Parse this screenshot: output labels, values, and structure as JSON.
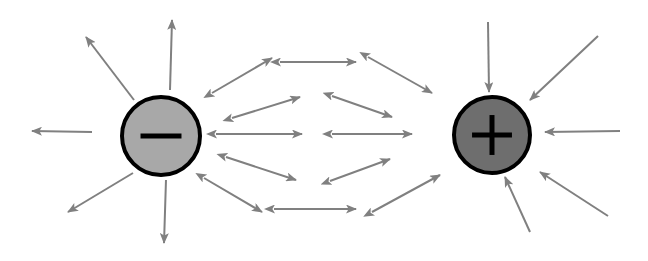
{
  "figure": {
    "width": 648,
    "height": 261,
    "background_color": "#ffffff"
  },
  "colors": {
    "arrow": "#808080",
    "arrow_dark": "#707070",
    "negative_fill": "#a8a8a8",
    "positive_fill": "#6e6e6e",
    "charge_outline": "#000000",
    "sign_glyph": "#000000"
  },
  "charges": [
    {
      "id": "negative-charge",
      "sign": "−",
      "sign_name": "minus",
      "cx": 161,
      "cy": 136,
      "r": 39,
      "fill": "#a8a8a8",
      "stroke": "#000000",
      "stroke_width": 4,
      "label": "negative charge"
    },
    {
      "id": "positive-charge",
      "sign": "+",
      "sign_name": "plus",
      "cx": 492,
      "cy": 135,
      "r": 38,
      "fill": "#6e6e6e",
      "stroke": "#000000",
      "stroke_width": 4,
      "label": "positive charge"
    }
  ],
  "field_arrows": {
    "single_headed": [
      {
        "name": "arrow-neg-up",
        "x1": 170,
        "y1": 90,
        "x2": 172,
        "y2": 20
      },
      {
        "name": "arrow-neg-upleft",
        "x1": 134,
        "y1": 100,
        "x2": 86,
        "y2": 37
      },
      {
        "name": "arrow-neg-left",
        "x1": 92,
        "y1": 132,
        "x2": 32,
        "y2": 131
      },
      {
        "name": "arrow-neg-downleft",
        "x1": 133,
        "y1": 173,
        "x2": 68,
        "y2": 212
      },
      {
        "name": "arrow-neg-down",
        "x1": 166,
        "y1": 180,
        "x2": 164,
        "y2": 243
      },
      {
        "name": "arrow-pos-down-top",
        "x1": 488,
        "y1": 22,
        "x2": 489,
        "y2": 92
      },
      {
        "name": "arrow-pos-upright-in",
        "x1": 598,
        "y1": 36,
        "x2": 530,
        "y2": 100
      },
      {
        "name": "arrow-pos-right",
        "x1": 620,
        "y1": 131,
        "x2": 545,
        "y2": 132
      },
      {
        "name": "arrow-pos-downright-in",
        "x1": 608,
        "y1": 216,
        "x2": 540,
        "y2": 172
      },
      {
        "name": "arrow-pos-up-bottom",
        "x1": 530,
        "y1": 232,
        "x2": 505,
        "y2": 177
      }
    ],
    "double_headed": [
      {
        "name": "arrow-upper-outer-left",
        "x1": 212,
        "y1": 93,
        "x2": 272,
        "y2": 58
      },
      {
        "name": "arrow-upper-top",
        "x1": 280,
        "y1": 62,
        "x2": 356,
        "y2": 62
      },
      {
        "name": "arrow-upper-outer-right",
        "x1": 368,
        "y1": 57,
        "x2": 432,
        "y2": 93
      },
      {
        "name": "arrow-upper-inner-left",
        "x1": 232,
        "y1": 118,
        "x2": 300,
        "y2": 97
      },
      {
        "name": "arrow-upper-inner-right",
        "x1": 332,
        "y1": 96,
        "x2": 392,
        "y2": 117
      },
      {
        "name": "arrow-center-left",
        "x1": 216,
        "y1": 134,
        "x2": 302,
        "y2": 134
      },
      {
        "name": "arrow-center-right",
        "x1": 332,
        "y1": 134,
        "x2": 412,
        "y2": 134
      },
      {
        "name": "arrow-lower-inner-left",
        "x1": 226,
        "y1": 157,
        "x2": 296,
        "y2": 180
      },
      {
        "name": "arrow-lower-inner-right",
        "x1": 330,
        "y1": 181,
        "x2": 390,
        "y2": 159
      },
      {
        "name": "arrow-lower-outer-left",
        "x1": 204,
        "y1": 178,
        "x2": 262,
        "y2": 212
      },
      {
        "name": "arrow-lower-bottom",
        "x1": 274,
        "y1": 209,
        "x2": 356,
        "y2": 209
      },
      {
        "name": "arrow-lower-outer-right",
        "x1": 372,
        "y1": 212,
        "x2": 440,
        "y2": 175
      }
    ]
  }
}
